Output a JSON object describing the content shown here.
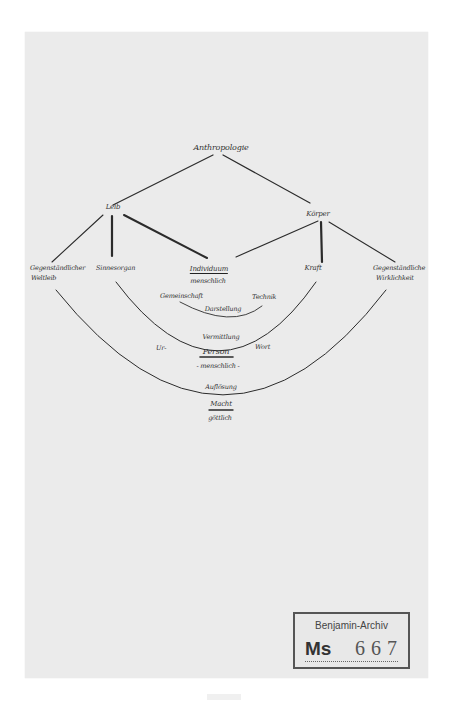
{
  "document": {
    "type": "handwritten manuscript diagram",
    "paper_color": "#ebebeb",
    "ink_color": "#333333"
  },
  "diagram": {
    "root": "Anthropologie",
    "level1": {
      "left": "Leib",
      "right": "Körper"
    },
    "level2": {
      "far_left_line1": "Gegenständlicher",
      "far_left_line2": "Weltleib",
      "left": "Sinnesorgan",
      "center": "Individuum",
      "center_sub": "menschlich",
      "right": "Kraft",
      "far_right_line1": "Gegenständliche",
      "far_right_line2": "Wirklichkeit"
    },
    "inner_arc": {
      "left": "Gemeinschaft",
      "right": "Technik",
      "bottom": "Darstellung"
    },
    "middle": {
      "top": "Vermittlung",
      "left": "Ur-",
      "right": "Wort",
      "center": "Person",
      "center_sub": "- menschlich -"
    },
    "bottom": {
      "line1": "Auflösung",
      "line2": "Macht",
      "line3": "göttlich"
    }
  },
  "stamp": {
    "title": "Benjamin-Archiv",
    "prefix": "Ms",
    "number": "667"
  }
}
